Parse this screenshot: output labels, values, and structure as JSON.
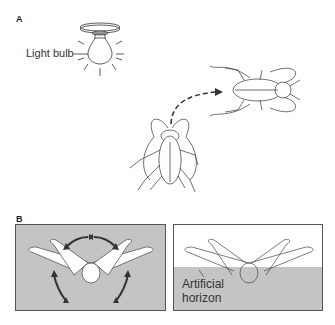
{
  "figure": {
    "panel_a": {
      "label": "A",
      "bulb_label": "Light bulb"
    },
    "panel_b": {
      "label": "B",
      "horizon_label_line1": "Artificial",
      "horizon_label_line2": "horizon"
    },
    "colors": {
      "gray_fill": "#c4c4c4",
      "line": "#333333",
      "arrow": "#333333"
    }
  }
}
